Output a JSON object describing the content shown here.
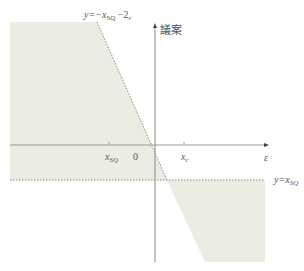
{
  "diagram": {
    "colors": {
      "shade": "#ecece2",
      "axis": "#9a9a9a",
      "dotted": "#8a8a8a",
      "text": "#555555"
    },
    "labels": {
      "top_line_lhs": "y=−x",
      "top_line_sub": "SQ",
      "top_line_rhs": " −2",
      "top_line_rhs_sub": "ε",
      "y_axis": "議案",
      "x_axis": "ε",
      "x_sq": "x",
      "x_sq_sub": "SQ",
      "origin": "0",
      "x_c": "x",
      "x_c_sub": "c",
      "bottom_line_lhs": "y=x",
      "bottom_line_sub": "SQ"
    }
  }
}
